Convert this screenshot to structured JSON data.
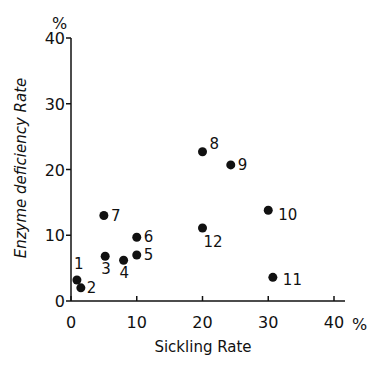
{
  "chart_data": {
    "type": "scatter",
    "title": "",
    "xlabel": "Sickling Rate",
    "ylabel": "Enzyme deficiency Rate",
    "x_unit": "%",
    "y_unit": "%",
    "xlim": [
      0,
      40
    ],
    "ylim": [
      0,
      40
    ],
    "xticks": [
      0,
      10,
      20,
      30,
      40
    ],
    "yticks": [
      0,
      10,
      20,
      30,
      40
    ],
    "xtick_labels": [
      "0",
      "10",
      "20",
      "30",
      "40"
    ],
    "ytick_labels": [
      "0",
      "10",
      "20",
      "30",
      "40"
    ],
    "grid": false,
    "legend": null,
    "points": [
      {
        "label": "1",
        "x": 0.9,
        "y": 3.2
      },
      {
        "label": "2",
        "x": 1.5,
        "y": 2.0
      },
      {
        "label": "3",
        "x": 5.2,
        "y": 6.8
      },
      {
        "label": "4",
        "x": 8.0,
        "y": 6.2
      },
      {
        "label": "5",
        "x": 10.0,
        "y": 7.0
      },
      {
        "label": "6",
        "x": 10.0,
        "y": 9.7
      },
      {
        "label": "7",
        "x": 5.0,
        "y": 13.0
      },
      {
        "label": "8",
        "x": 20.0,
        "y": 22.7
      },
      {
        "label": "9",
        "x": 24.3,
        "y": 20.7
      },
      {
        "label": "10",
        "x": 30.0,
        "y": 13.8
      },
      {
        "label": "11",
        "x": 30.7,
        "y": 3.6
      },
      {
        "label": "12",
        "x": 20.0,
        "y": 11.1
      }
    ]
  },
  "labels": {
    "x_axis_title": "Sickling Rate",
    "y_axis_title": "Enzyme deficiency Rate",
    "x_unit": "%",
    "y_unit": "%"
  }
}
